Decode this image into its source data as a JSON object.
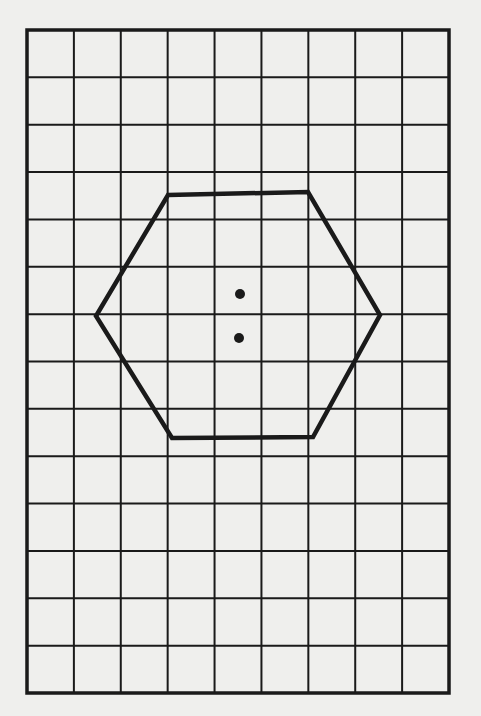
{
  "diagram": {
    "type": "grid-with-hexagon",
    "background_color": "#efefed",
    "line_color": "#1a1a1a",
    "grid": {
      "columns": 9,
      "rows": 14,
      "left": 27,
      "top": 30,
      "right": 449,
      "bottom": 693,
      "border_width": 3.5,
      "line_width": 2
    },
    "hexagon": {
      "stroke_width": 4.5,
      "vertices": [
        [
          168,
          195
        ],
        [
          308,
          192
        ],
        [
          380,
          315
        ],
        [
          313,
          437
        ],
        [
          172,
          438
        ],
        [
          96,
          316
        ]
      ]
    },
    "dots": [
      {
        "x": 240,
        "y": 294,
        "r": 5
      },
      {
        "x": 239,
        "y": 338,
        "r": 5
      }
    ]
  }
}
